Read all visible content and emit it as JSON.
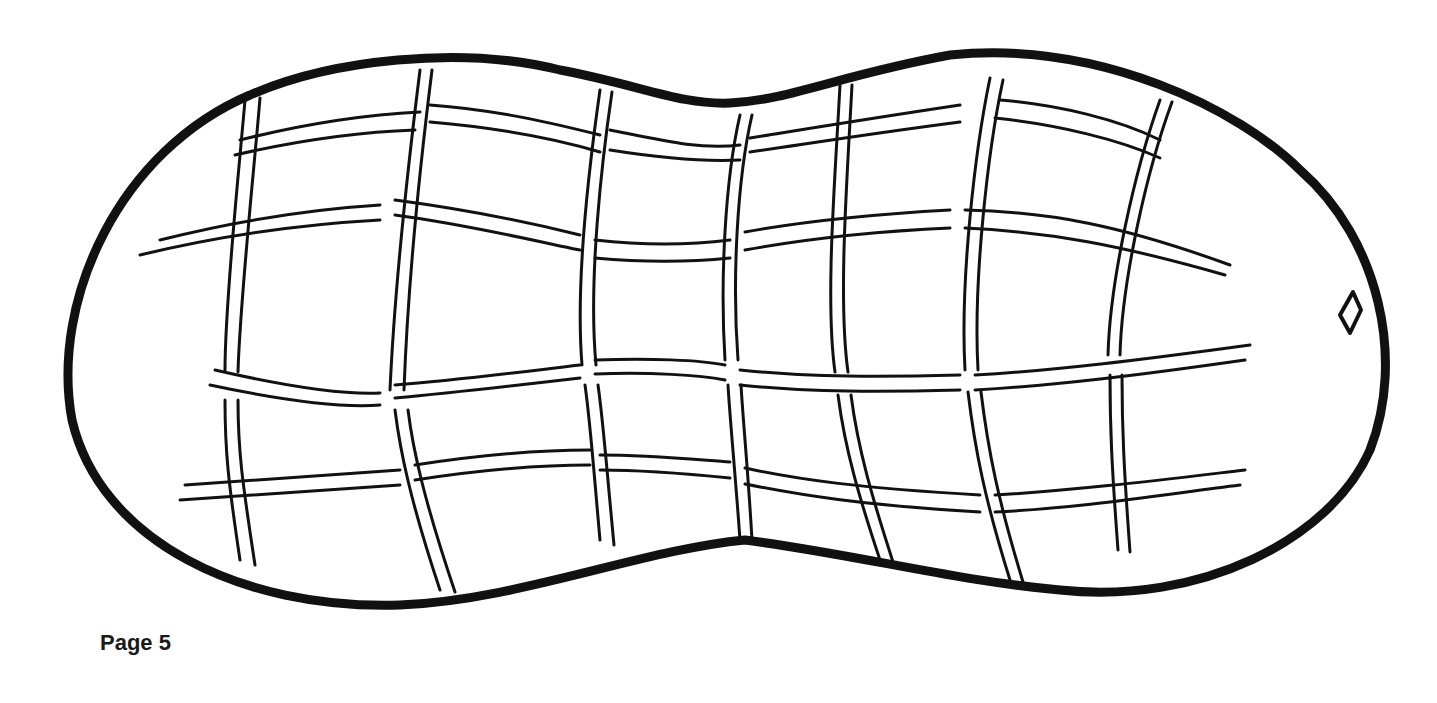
{
  "page": {
    "label": "Page 5",
    "background": "#ffffff",
    "ink_color": "#111111"
  },
  "illustration": {
    "subject": "peanut-shell",
    "style": "line-art-coloring-page",
    "features": [
      "outline",
      "grid-texture",
      "small-diamond-tip"
    ]
  }
}
